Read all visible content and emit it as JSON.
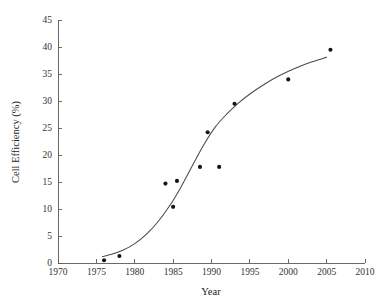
{
  "chart_data": {
    "type": "scatter",
    "title": "",
    "subtitle": "",
    "xlabel": "Year",
    "ylabel": "Cell Efficiency (%)",
    "xlim": [
      1970,
      2010
    ],
    "ylim": [
      0,
      45
    ],
    "xticks": [
      1970,
      1975,
      1980,
      1985,
      1990,
      1995,
      2000,
      2005,
      2010
    ],
    "yticks": [
      0,
      5,
      10,
      15,
      20,
      25,
      30,
      35,
      40,
      45
    ],
    "xtick_labels": [
      "1970",
      "1975",
      "1980",
      "1985",
      "1990",
      "1995",
      "2000",
      "2005",
      "2010"
    ],
    "ytick_labels": [
      "0",
      "5",
      "10",
      "15",
      "20",
      "25",
      "30",
      "35",
      "40",
      "45"
    ],
    "grid": false,
    "legend": false,
    "legend_position": "none",
    "marker_style": "filled-circle",
    "marker_color": "#141414",
    "curve_color": "#4a4a4a",
    "axis_color": "#5a5a5a",
    "background_color": "#ffffff",
    "series": [
      {
        "name": "Measured cell efficiency",
        "type": "scatter",
        "x": [
          1976.0,
          1978.0,
          1984.0,
          1985.0,
          1985.5,
          1988.5,
          1989.5,
          1991.0,
          1993.0,
          2000.0,
          2005.5
        ],
        "y": [
          0.5,
          1.3,
          14.7,
          10.4,
          15.2,
          17.8,
          24.2,
          17.8,
          29.5,
          34.0,
          39.5
        ]
      },
      {
        "name": "Fitted trend curve",
        "type": "line",
        "x": [
          1975.8,
          1977.0,
          1978.5,
          1980.0,
          1981.5,
          1983.0,
          1984.5,
          1986.0,
          1987.5,
          1989.0,
          1990.5,
          1992.0,
          1993.5,
          1995.0,
          1997.0,
          1999.0,
          2001.0,
          2003.0,
          2005.0
        ],
        "y": [
          1.2,
          1.6,
          2.4,
          3.6,
          5.3,
          7.6,
          10.5,
          14.0,
          18.0,
          21.9,
          25.2,
          27.6,
          29.6,
          31.3,
          33.2,
          34.8,
          36.1,
          37.2,
          38.1
        ]
      }
    ]
  },
  "axes": {
    "x_axis_title": "Year",
    "y_axis_title": "Cell Efficiency (%)"
  }
}
